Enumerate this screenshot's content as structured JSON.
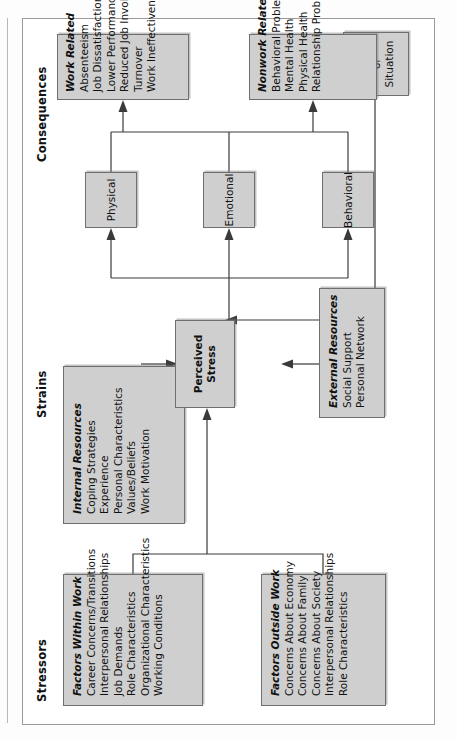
{
  "diagram": {
    "columns": [
      {
        "id": "stressors",
        "label": "Stressors"
      },
      {
        "id": "strains",
        "label": "Strains"
      },
      {
        "id": "consequences",
        "label": "Consequences"
      }
    ],
    "boxes": {
      "factors_within_work": {
        "title": "Factors Within Work",
        "items": [
          "Career Concerns/Transitions",
          "Interpersonal Relationships",
          "Job Demands",
          "Role Characteristics",
          "Organizational Characteristics",
          "Working Conditions"
        ]
      },
      "factors_outside_work": {
        "title": "Factors Outside Work",
        "items": [
          "Concerns About Economy",
          "Concerns About Family",
          "Concerns About Society",
          "Interpersonal Relationships",
          "Role Characteristics"
        ]
      },
      "internal_resources": {
        "title": "Internal Resources",
        "items": [
          "Coping Strategies",
          "Experience",
          "Personal Characteristics",
          "Values/Beliefs",
          "Work Motivation"
        ]
      },
      "external_resources": {
        "title": "External Resources",
        "items": [
          "Social Support",
          "Personal Network"
        ]
      },
      "appraisal": {
        "line1": "Appraisal",
        "line2": "of",
        "line3": "Situation"
      },
      "perceived_stress": {
        "line1": "Perceived",
        "line2": "Stress"
      },
      "strain_physical": {
        "label": "Physical"
      },
      "strain_emotional": {
        "label": "Emotional"
      },
      "strain_behavioral": {
        "label": "Behavioral"
      },
      "work_related": {
        "title": "Work Related",
        "items": [
          "Absenteeism",
          "Job Dissatisfaction",
          "Lower Performance",
          "Reduced Job Involvement",
          "Turnover",
          "Work Ineffectiveness"
        ]
      },
      "nonwork_related": {
        "title": "Nonwork Related",
        "items": [
          "Behavioral Problems",
          "Mental Health",
          "Physical Health",
          "Relationship Problems"
        ]
      }
    },
    "colors": {
      "box_fill": "#cfcfcf",
      "box_border": "#6f6f6f",
      "frame_border": "#9a9a9a",
      "connector": "#3a3a3a",
      "text": "#111111",
      "page_background": "#ffffff"
    }
  }
}
